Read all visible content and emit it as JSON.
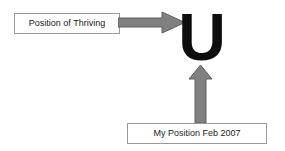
{
  "diagram": {
    "background_color": "#ffffff",
    "letter": {
      "glyph": "U",
      "color": "#0d0d0d",
      "description": "large bold letter U representing a U-shaped curve"
    },
    "labels": {
      "thriving": "Position of Thriving",
      "my_position": "My Position Feb 2007"
    },
    "label_style": {
      "border_color": "#9a9a9a",
      "background_color": "#ffffff",
      "text_color": "#1a1a1a"
    },
    "arrows": {
      "horizontal": {
        "name": "arrow-right",
        "direction": "right",
        "fill_color": "#808080",
        "stroke_color": "#5e5e5e",
        "points_to": "U",
        "from_label": "Position of Thriving"
      },
      "vertical": {
        "name": "arrow-up",
        "direction": "up",
        "fill_color": "#808080",
        "stroke_color": "#5e5e5e",
        "points_to": "U",
        "from_label": "My Position Feb 2007"
      }
    }
  }
}
